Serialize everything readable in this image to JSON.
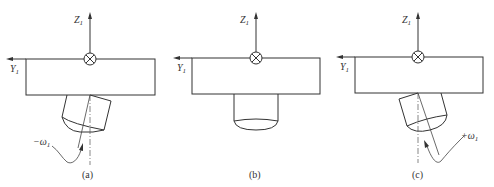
{
  "figure": {
    "panels": [
      {
        "id": "a",
        "caption": "(a)",
        "z_axis": {
          "label": "Z",
          "subscript": "1"
        },
        "y_axis": {
          "label": "Y",
          "subscript": "1"
        },
        "rotation": {
          "label": "−ω",
          "subscript": "1",
          "direction": "negative"
        },
        "tool_tilt": "left"
      },
      {
        "id": "b",
        "caption": "(b)",
        "z_axis": {
          "label": "Z",
          "subscript": "1"
        },
        "y_axis": {
          "label": "Y",
          "subscript": "1"
        },
        "tool_tilt": "none"
      },
      {
        "id": "c",
        "caption": "(c)",
        "z_axis": {
          "label": "Z",
          "subscript": "1"
        },
        "y_axis": {
          "label": "Y",
          "subscript": "1"
        },
        "rotation": {
          "label": "+ω",
          "subscript": "1",
          "direction": "positive"
        },
        "tool_tilt": "right"
      }
    ],
    "symbols": {
      "x_axis_into_page": "circle-cross"
    },
    "colors": {
      "line": "#333333",
      "background": "#ffffff"
    }
  }
}
